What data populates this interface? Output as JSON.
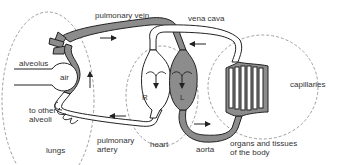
{
  "diagram": {
    "labels": {
      "pulmonary_vein": "pulmonary vein",
      "vena_cava": "vena cava",
      "alveolus": "alveolus",
      "air": "air",
      "to_other_alveoli_1": "to other",
      "to_other_alveoli_2": "alveoli",
      "lungs": "lungs",
      "pulmonary_artery_1": "pulmonary",
      "pulmonary_artery_2": "artery",
      "heart": "heart",
      "right_chamber": "R",
      "left_chamber": "L",
      "aorta": "aorta",
      "capillaries": "capillaries",
      "organs_1": "organs and tissues",
      "organs_2": "of the body"
    },
    "colors": {
      "oxygenated": "#8c8c8c",
      "deoxygenated": "#ffffff",
      "outline": "#222222",
      "region_dash": "#888888",
      "text": "#333333"
    },
    "flow_arrows": [
      {
        "location": "pulmonary vein",
        "direction": "right"
      },
      {
        "location": "vena cava",
        "direction": "left"
      },
      {
        "location": "lung capillary",
        "direction": "up"
      },
      {
        "location": "pulmonary artery",
        "direction": "left"
      },
      {
        "location": "aorta",
        "direction": "right"
      },
      {
        "location": "right chamber",
        "direction": "down"
      },
      {
        "location": "left chamber",
        "direction": "down"
      }
    ]
  }
}
